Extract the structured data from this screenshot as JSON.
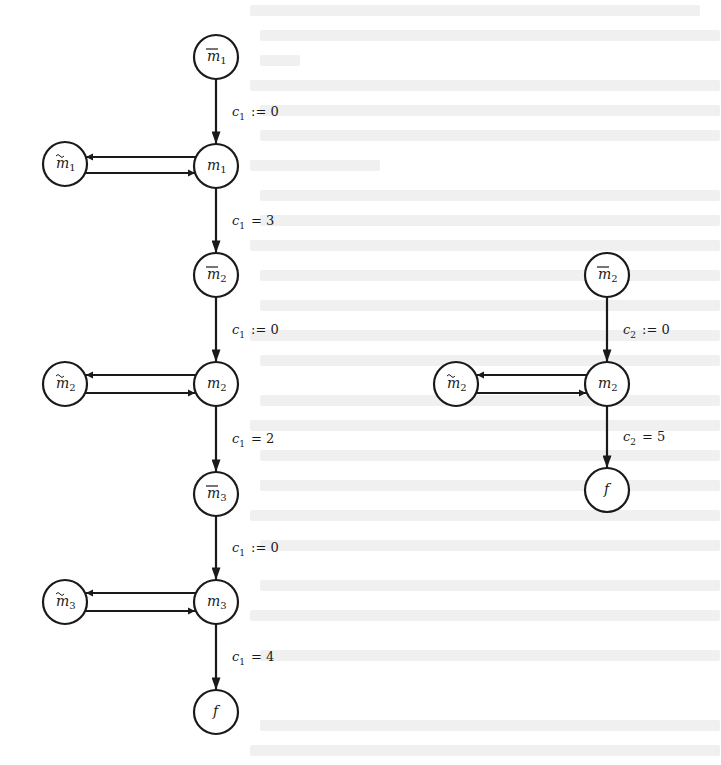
{
  "diagram": {
    "colors": {
      "stroke": "#1a1a1a",
      "background": "#ffffff",
      "bleed_through": "#f0f0f0"
    },
    "left_graph": {
      "nodes": [
        {
          "id": "mbar1",
          "base": "m",
          "sub": "1",
          "decoration": "overline",
          "x": 216,
          "y": 57
        },
        {
          "id": "mtilde1",
          "base": "m",
          "sub": "1",
          "decoration": "tilde",
          "x": 65,
          "y": 164
        },
        {
          "id": "m1",
          "base": "m",
          "sub": "1",
          "decoration": "none",
          "x": 216,
          "y": 166
        },
        {
          "id": "mbar2",
          "base": "m",
          "sub": "2",
          "decoration": "overline",
          "x": 216,
          "y": 275
        },
        {
          "id": "mtilde2",
          "base": "m",
          "sub": "2",
          "decoration": "tilde",
          "x": 65,
          "y": 384
        },
        {
          "id": "m2",
          "base": "m",
          "sub": "2",
          "decoration": "none",
          "x": 216,
          "y": 384
        },
        {
          "id": "mbar3",
          "base": "m",
          "sub": "3",
          "decoration": "overline",
          "x": 216,
          "y": 494
        },
        {
          "id": "mtilde3",
          "base": "m",
          "sub": "3",
          "decoration": "tilde",
          "x": 65,
          "y": 602
        },
        {
          "id": "m3",
          "base": "m",
          "sub": "3",
          "decoration": "none",
          "x": 216,
          "y": 602
        },
        {
          "id": "f",
          "base": "f",
          "sub": "",
          "decoration": "none",
          "x": 216,
          "y": 712
        }
      ],
      "edges": [
        {
          "from": "mbar1",
          "to": "m1",
          "label_var": "c",
          "label_sub": "1",
          "label_op": ":= 0"
        },
        {
          "from": "m1",
          "to": "mtilde1",
          "label_var": "",
          "label_sub": "",
          "label_op": ""
        },
        {
          "from": "mtilde1",
          "to": "m1",
          "label_var": "",
          "label_sub": "",
          "label_op": ""
        },
        {
          "from": "m1",
          "to": "mbar2",
          "label_var": "c",
          "label_sub": "1",
          "label_op": "= 3"
        },
        {
          "from": "mbar2",
          "to": "m2",
          "label_var": "c",
          "label_sub": "1",
          "label_op": ":= 0"
        },
        {
          "from": "m2",
          "to": "mtilde2",
          "label_var": "",
          "label_sub": "",
          "label_op": ""
        },
        {
          "from": "mtilde2",
          "to": "m2",
          "label_var": "",
          "label_sub": "",
          "label_op": ""
        },
        {
          "from": "m2",
          "to": "mbar3",
          "label_var": "c",
          "label_sub": "1",
          "label_op": "= 2"
        },
        {
          "from": "mbar3",
          "to": "m3",
          "label_var": "c",
          "label_sub": "1",
          "label_op": ":= 0"
        },
        {
          "from": "m3",
          "to": "mtilde3",
          "label_var": "",
          "label_sub": "",
          "label_op": ""
        },
        {
          "from": "mtilde3",
          "to": "m3",
          "label_var": "",
          "label_sub": "",
          "label_op": ""
        },
        {
          "from": "m3",
          "to": "f",
          "label_var": "c",
          "label_sub": "1",
          "label_op": "= 4"
        }
      ]
    },
    "right_graph": {
      "nodes": [
        {
          "id": "r_mbar2",
          "base": "m",
          "sub": "2",
          "decoration": "overline",
          "x": 607,
          "y": 275
        },
        {
          "id": "r_mtilde2",
          "base": "m",
          "sub": "2",
          "decoration": "tilde",
          "x": 456,
          "y": 384
        },
        {
          "id": "r_m2",
          "base": "m",
          "sub": "2",
          "decoration": "none",
          "x": 607,
          "y": 384
        },
        {
          "id": "r_f",
          "base": "f",
          "sub": "",
          "decoration": "none",
          "x": 607,
          "y": 490
        }
      ],
      "edges": [
        {
          "from": "r_mbar2",
          "to": "r_m2",
          "label_var": "c",
          "label_sub": "2",
          "label_op": ":= 0"
        },
        {
          "from": "r_m2",
          "to": "r_mtilde2",
          "label_var": "",
          "label_sub": "",
          "label_op": ""
        },
        {
          "from": "r_mtilde2",
          "to": "r_m2",
          "label_var": "",
          "label_sub": "",
          "label_op": ""
        },
        {
          "from": "r_m2",
          "to": "r_f",
          "label_var": "c",
          "label_sub": "2",
          "label_op": "= 5"
        }
      ]
    }
  }
}
